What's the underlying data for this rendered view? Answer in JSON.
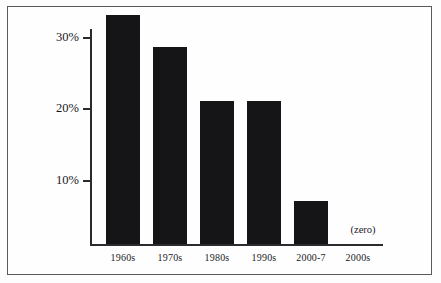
{
  "chart_data": {
    "type": "bar",
    "title": "",
    "subtitle": "",
    "xlabel": "",
    "ylabel": "",
    "categories": [
      "1960s",
      "1970s",
      "1980s",
      "1990s",
      "2000-7",
      "2000s"
    ],
    "values": [
      32,
      27.5,
      20,
      20,
      6,
      0
    ],
    "value_labels": [
      "",
      "",
      "",
      "",
      "",
      ""
    ],
    "ylim": [
      0,
      32.5
    ],
    "y_ticks": [
      10,
      20,
      30
    ],
    "y_tick_labels": [
      "10%",
      "20%",
      "30%"
    ],
    "grid": false,
    "legend": null,
    "annotations": [
      {
        "name": "zero-note",
        "text": "(zero)",
        "category": "2000s"
      }
    ],
    "bar_color": "#151517",
    "axis_color": "#2b2b2e",
    "background_color": "#fefefe",
    "border_color": "#5a5a5e"
  },
  "axis": {
    "y_labels": [
      "30%",
      "20%",
      "10%"
    ],
    "x_labels": [
      "1960s",
      "1970s",
      "1980s",
      "1990s",
      "2000-7",
      "2000s"
    ]
  },
  "notes": {
    "zero": "(zero)"
  }
}
